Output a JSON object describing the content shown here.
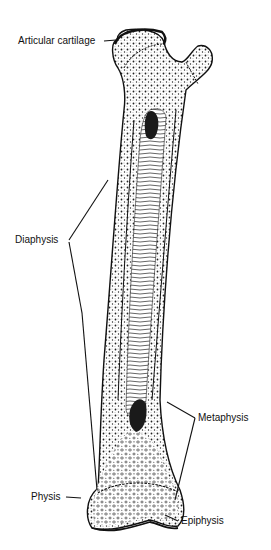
{
  "diagram": {
    "labels": {
      "articular_cartilage": "Articular cartilage",
      "diaphysis": "Diaphysis",
      "metaphysis": "Metaphysis",
      "physis": "Physis",
      "epiphysis": "Epiphysis"
    },
    "colors": {
      "ink": "#111111",
      "background": "#ffffff",
      "spongy_fill": "#f4f4f4"
    }
  }
}
